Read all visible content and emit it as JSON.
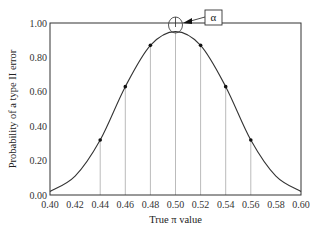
{
  "chart_data": {
    "type": "line",
    "title": "",
    "xlabel": "True π value",
    "ylabel": "Probability of a type II error",
    "xlim": [
      0.4,
      0.6
    ],
    "ylim": [
      0.0,
      1.0
    ],
    "x_ticks": [
      "0.40",
      "0.42",
      "0.44",
      "0.46",
      "0.48",
      "0.50",
      "0.52",
      "0.54",
      "0.56",
      "0.58",
      "0.60"
    ],
    "y_ticks": [
      "0.00",
      "0.20",
      "0.40",
      "0.60",
      "0.80",
      "1.00"
    ],
    "grid": false,
    "legend": null,
    "series": [
      {
        "name": "Type II error curve",
        "x": [
          0.4,
          0.42,
          0.44,
          0.46,
          0.48,
          0.5,
          0.52,
          0.54,
          0.56,
          0.58,
          0.6
        ],
        "values": [
          0.02,
          0.11,
          0.32,
          0.63,
          0.87,
          0.95,
          0.87,
          0.63,
          0.32,
          0.11,
          0.02
        ]
      }
    ],
    "marked_points": [
      {
        "x": 0.44,
        "y": 0.32
      },
      {
        "x": 0.46,
        "y": 0.63
      },
      {
        "x": 0.48,
        "y": 0.87
      },
      {
        "x": 0.5,
        "y": 0.95
      },
      {
        "x": 0.52,
        "y": 0.87
      },
      {
        "x": 0.54,
        "y": 0.63
      },
      {
        "x": 0.56,
        "y": 0.32
      }
    ],
    "drop_lines_at_x": [
      0.44,
      0.46,
      0.48,
      0.5,
      0.52,
      0.54,
      0.56
    ],
    "annotations": [
      {
        "text": "α",
        "points_to": {
          "x": 0.5,
          "y": 1.0
        },
        "style": "boxed label with arrow to circled gap between curve peak and 1.00"
      }
    ]
  },
  "colors": {
    "curve": "#333333",
    "axes": "#333333",
    "drop_lines": "#bbbbbb",
    "markers": "#111111"
  }
}
